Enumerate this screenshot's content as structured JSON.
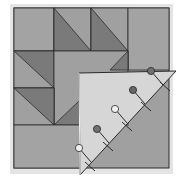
{
  "illustration": {
    "subject": "quilt block with folded corner pinned",
    "colors": {
      "background": "#ffffff",
      "shadow": "#d9d9d9",
      "medium": "#9a9a9a",
      "light_square": "#a3a3a3",
      "dark_triangle": "#7a7a7a",
      "seam": "#2a2a2a",
      "folded_corner": "#d6d6d6",
      "pin_dark": "#707070",
      "pin_light": "#efefef"
    },
    "block": {
      "x": 14,
      "y": 8,
      "size": 155,
      "grid": 4
    },
    "pins": [
      {
        "x": 151,
        "y": 71,
        "shade": "dark"
      },
      {
        "x": 133,
        "y": 90,
        "shade": "dark"
      },
      {
        "x": 115,
        "y": 109,
        "shade": "light"
      },
      {
        "x": 97,
        "y": 129,
        "shade": "dark"
      },
      {
        "x": 79,
        "y": 148,
        "shade": "light"
      }
    ],
    "stitches": [
      {
        "x": 165,
        "y": 86
      },
      {
        "x": 146,
        "y": 106
      },
      {
        "x": 127,
        "y": 126
      },
      {
        "x": 108,
        "y": 146
      },
      {
        "x": 90,
        "y": 166
      }
    ]
  }
}
